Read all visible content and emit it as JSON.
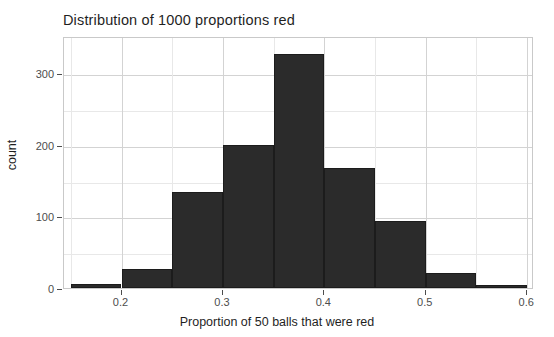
{
  "chart_data": {
    "type": "bar",
    "title": "Distribution of 1000 proportions red",
    "xlabel": "Proportion of 50 balls that were red",
    "ylabel": "count",
    "categories": [
      "0.150-0.200",
      "0.200-0.250",
      "0.250-0.300",
      "0.300-0.350",
      "0.350-0.400",
      "0.400-0.450",
      "0.450-0.500",
      "0.500-0.550",
      "0.550-0.600"
    ],
    "bin_edges": [
      0.15,
      0.2,
      0.25,
      0.3,
      0.35,
      0.4,
      0.45,
      0.5,
      0.55,
      0.6
    ],
    "bin_width": 0.05,
    "values": [
      6,
      26,
      134,
      200,
      327,
      167,
      93,
      21,
      3
    ],
    "xlim": [
      0.1433,
      0.6067
    ],
    "ylim": [
      0,
      352
    ],
    "xticks": [
      0.2,
      0.3,
      0.4,
      0.5,
      0.6
    ],
    "xtick_labels": [
      "0.2",
      "0.3",
      "0.4",
      "0.5",
      "0.6"
    ],
    "xticks_minor": [
      0.15,
      0.25,
      0.35,
      0.45,
      0.55
    ],
    "yticks": [
      0,
      100,
      200,
      300
    ],
    "ytick_labels": [
      "0",
      "100",
      "200",
      "300"
    ],
    "yticks_minor": [
      50,
      150,
      250
    ],
    "grid": true,
    "legend": "none",
    "bar_color": "#2b2b2b",
    "panel_background": "#ffffff",
    "grid_color_major": "#d3d3d3",
    "grid_color_minor": "#e8e8e8"
  }
}
